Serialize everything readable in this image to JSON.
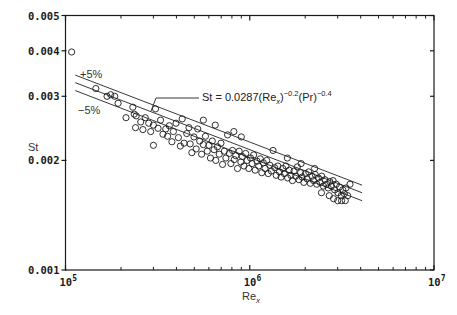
{
  "chart_data": {
    "type": "scatter",
    "title": "",
    "xlabel": "Re_x",
    "xlabel_parts": {
      "base": "Re",
      "sub": "x"
    },
    "ylabel": "St",
    "xscale": "log",
    "yscale": "log",
    "xlim": [
      100000,
      10000000
    ],
    "ylim": [
      0.001,
      0.005
    ],
    "x_ticks": [
      {
        "value": 100000,
        "base": "10",
        "exp": "5"
      },
      {
        "value": 1000000,
        "base": "10",
        "exp": "6"
      },
      {
        "value": 10000000,
        "base": "10",
        "exp": "7"
      }
    ],
    "y_ticks": [
      {
        "value": 0.001,
        "label": "0.001"
      },
      {
        "value": 0.002,
        "label": "0.002"
      },
      {
        "value": 0.003,
        "label": "0.003"
      },
      {
        "value": 0.004,
        "label": "0.004"
      },
      {
        "value": 0.005,
        "label": "0.005"
      }
    ],
    "grid": false,
    "legend": null,
    "annotations": {
      "equation": {
        "prefix": "St = 0.0287(Re",
        "sub": "x",
        "sup1": "−0.2",
        "mid": "(Pr)",
        "sup2": "−0.4"
      },
      "upper_band": "+5%",
      "lower_band": "−5%"
    },
    "correlation_lines": [
      {
        "name": "+5%",
        "x": [
          113000,
          4070000
        ],
        "y": [
          0.00343,
          0.00171
        ]
      },
      {
        "name": "correlation",
        "x": [
          113000,
          4070000
        ],
        "y": [
          0.00327,
          0.00163
        ]
      },
      {
        "name": "−5%",
        "x": [
          113000,
          4070000
        ],
        "y": [
          0.00311,
          0.00155
        ]
      }
    ],
    "series": [
      {
        "name": "data",
        "marker": "open-circle",
        "points": [
          [
            108000,
            0.00397
          ],
          [
            146000,
            0.00315
          ],
          [
            168000,
            0.003
          ],
          [
            176000,
            0.00303
          ],
          [
            185000,
            0.003
          ],
          [
            193000,
            0.00287
          ],
          [
            213000,
            0.00262
          ],
          [
            232000,
            0.0028
          ],
          [
            236000,
            0.00268
          ],
          [
            242000,
            0.00265
          ],
          [
            240000,
            0.00246
          ],
          [
            256000,
            0.00255
          ],
          [
            263000,
            0.00243
          ],
          [
            271000,
            0.00262
          ],
          [
            283000,
            0.00253
          ],
          [
            290000,
            0.0024
          ],
          [
            300000,
            0.0025
          ],
          [
            308000,
            0.00277
          ],
          [
            300000,
            0.0022
          ],
          [
            318000,
            0.00245
          ],
          [
            328000,
            0.00258
          ],
          [
            338000,
            0.00236
          ],
          [
            350000,
            0.00244
          ],
          [
            358000,
            0.00233
          ],
          [
            366000,
            0.00249
          ],
          [
            378000,
            0.00225
          ],
          [
            385000,
            0.0024
          ],
          [
            398000,
            0.00253
          ],
          [
            410000,
            0.00231
          ],
          [
            420000,
            0.00219
          ],
          [
            430000,
            0.0026
          ],
          [
            440000,
            0.00223
          ],
          [
            455000,
            0.00237
          ],
          [
            468000,
            0.00246
          ],
          [
            475000,
            0.00222
          ],
          [
            485000,
            0.0021
          ],
          [
            498000,
            0.00232
          ],
          [
            512000,
            0.00215
          ],
          [
            522000,
            0.00244
          ],
          [
            535000,
            0.00226
          ],
          [
            548000,
            0.00208
          ],
          [
            560000,
            0.00221
          ],
          [
            575000,
            0.00233
          ],
          [
            588000,
            0.00212
          ],
          [
            600000,
            0.0022
          ],
          [
            612000,
            0.00203
          ],
          [
            626000,
            0.00226
          ],
          [
            640000,
            0.00214
          ],
          [
            654000,
            0.002
          ],
          [
            668000,
            0.00218
          ],
          [
            683000,
            0.00208
          ],
          [
            698000,
            0.00223
          ],
          [
            712000,
            0.00195
          ],
          [
            728000,
            0.00212
          ],
          [
            742000,
            0.00203
          ],
          [
            758000,
            0.00235
          ],
          [
            775000,
            0.00209
          ],
          [
            790000,
            0.00196
          ],
          [
            806000,
            0.00213
          ],
          [
            824000,
            0.00201
          ],
          [
            840000,
            0.00206
          ],
          [
            858000,
            0.0019
          ],
          [
            876000,
            0.00212
          ],
          [
            895000,
            0.00198
          ],
          [
            912000,
            0.00205
          ],
          [
            930000,
            0.00193
          ],
          [
            950000,
            0.00209
          ],
          [
            968000,
            0.002
          ],
          [
            988000,
            0.0019
          ],
          [
            1010000,
            0.00203
          ],
          [
            1030000,
            0.00196
          ],
          [
            1050000,
            0.00207
          ],
          [
            1070000,
            0.00188
          ],
          [
            1095000,
            0.00199
          ],
          [
            1118000,
            0.00193
          ],
          [
            1140000,
            0.00202
          ],
          [
            1162000,
            0.00185
          ],
          [
            1185000,
            0.00197
          ],
          [
            1210000,
            0.0019
          ],
          [
            1235000,
            0.002
          ],
          [
            1260000,
            0.00184
          ],
          [
            1285000,
            0.00194
          ],
          [
            1310000,
            0.00187
          ],
          [
            1338000,
            0.00213
          ],
          [
            1365000,
            0.00191
          ],
          [
            1392000,
            0.00182
          ],
          [
            1420000,
            0.00193
          ],
          [
            1450000,
            0.00186
          ],
          [
            1480000,
            0.0018
          ],
          [
            1510000,
            0.0019
          ],
          [
            1540000,
            0.00184
          ],
          [
            1572000,
            0.00193
          ],
          [
            1605000,
            0.00179
          ],
          [
            1638000,
            0.00188
          ],
          [
            1672000,
            0.00182
          ],
          [
            1705000,
            0.00176
          ],
          [
            1740000,
            0.00187
          ],
          [
            1776000,
            0.00181
          ],
          [
            1812000,
            0.00192
          ],
          [
            1850000,
            0.00177
          ],
          [
            1888000,
            0.00185
          ],
          [
            1926000,
            0.0018
          ],
          [
            1966000,
            0.00174
          ],
          [
            2006000,
            0.00184
          ],
          [
            2048000,
            0.00178
          ],
          [
            2090000,
            0.00186
          ],
          [
            2132000,
            0.00173
          ],
          [
            2176000,
            0.00181
          ],
          [
            2220000,
            0.00176
          ],
          [
            2266000,
            0.00183
          ],
          [
            2312000,
            0.00172
          ],
          [
            2360000,
            0.00179
          ],
          [
            2408000,
            0.00174
          ],
          [
            2458000,
            0.00181
          ],
          [
            2508000,
            0.0017
          ],
          [
            2560000,
            0.00177
          ],
          [
            2612000,
            0.00172
          ],
          [
            2666000,
            0.00168
          ],
          [
            2720000,
            0.00175
          ],
          [
            2776000,
            0.0017
          ],
          [
            2832000,
            0.00176
          ],
          [
            2890000,
            0.00166
          ],
          [
            2950000,
            0.00172
          ],
          [
            3010000,
            0.00163
          ],
          [
            3072000,
            0.00169
          ],
          [
            3134000,
            0.0016
          ],
          [
            3198000,
            0.00166
          ],
          [
            3264000,
            0.00162
          ],
          [
            3330000,
            0.00168
          ],
          [
            3400000,
            0.0016
          ],
          [
            2700000,
            0.0016
          ],
          [
            2850000,
            0.00157
          ],
          [
            3000000,
            0.00155
          ],
          [
            3150000,
            0.00155
          ],
          [
            3300000,
            0.00155
          ],
          [
            2450000,
            0.00163
          ],
          [
            650000,
            0.0025
          ],
          [
            820000,
            0.0024
          ],
          [
            900000,
            0.00232
          ],
          [
            560000,
            0.00258
          ],
          [
            1600000,
            0.00203
          ],
          [
            1900000,
            0.00196
          ],
          [
            2250000,
            0.0019
          ],
          [
            3500000,
            0.00172
          ]
        ]
      }
    ]
  }
}
